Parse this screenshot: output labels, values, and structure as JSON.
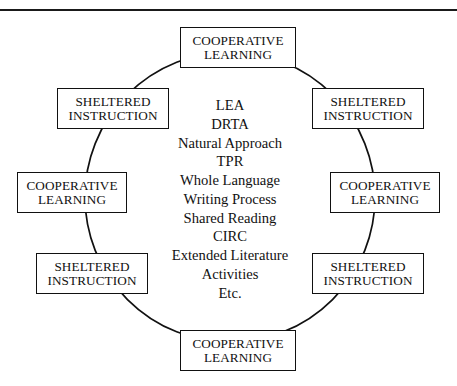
{
  "diagram": {
    "title_rule": "horizontal-divider",
    "shape": "circle",
    "stroke_color": "#111111",
    "background_color": "#ffffff",
    "nodes": [
      {
        "id": "node-top",
        "position": "top",
        "line1": "COOPERATIVE",
        "line2": "LEARNING"
      },
      {
        "id": "node-tr",
        "position": "top-right",
        "line1": "SHELTERED",
        "line2": "INSTRUCTION"
      },
      {
        "id": "node-right",
        "position": "right",
        "line1": "COOPERATIVE",
        "line2": "LEARNING"
      },
      {
        "id": "node-br",
        "position": "bottom-right",
        "line1": "SHELTERED",
        "line2": "INSTRUCTION"
      },
      {
        "id": "node-bottom",
        "position": "bottom",
        "line1": "COOPERATIVE",
        "line2": "LEARNING"
      },
      {
        "id": "node-bl",
        "position": "bottom-left",
        "line1": "SHELTERED",
        "line2": "INSTRUCTION"
      },
      {
        "id": "node-left",
        "position": "left",
        "line1": "COOPERATIVE",
        "line2": "LEARNING"
      },
      {
        "id": "node-tl",
        "position": "top-left",
        "line1": "SHELTERED",
        "line2": "INSTRUCTION"
      }
    ],
    "center_items": [
      "LEA",
      "DRTA",
      "Natural Approach",
      "TPR",
      "Whole Language",
      "Writing Process",
      "Shared Reading",
      "CIRC",
      "Extended Literature",
      "Activities",
      "Etc."
    ]
  }
}
